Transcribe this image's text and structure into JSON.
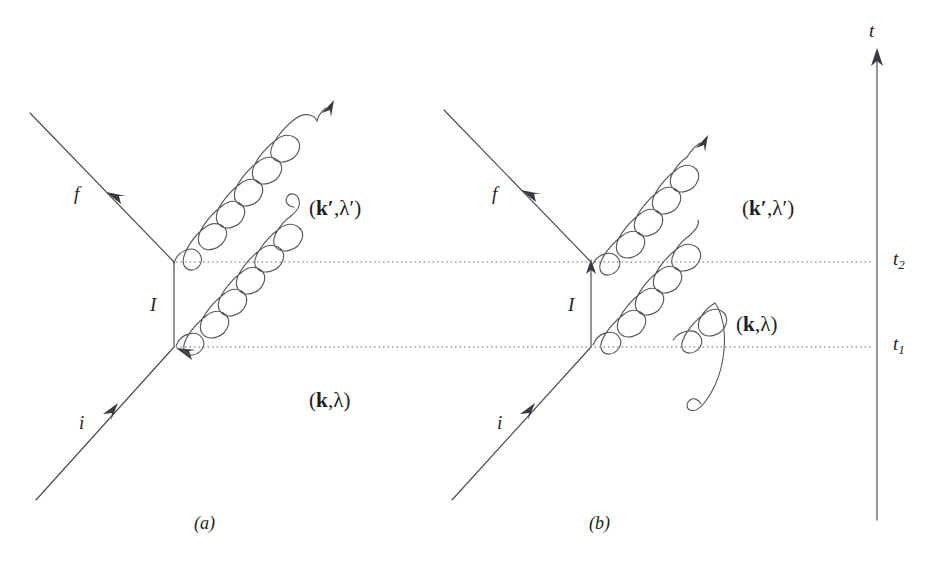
{
  "figure": {
    "type": "feynman-diagram-pair",
    "background_color": "#ffffff",
    "line_color": "#4a4a50",
    "text_color": "#1e1e22",
    "width": 933,
    "height": 566
  },
  "time_axis": {
    "label": "t",
    "direction": "upward",
    "x": 877,
    "top_y": 55,
    "bottom_y": 520,
    "ticks": [
      {
        "name": "t-two",
        "label": "t",
        "subscript": "2",
        "y": 262
      },
      {
        "name": "t-one",
        "label": "t",
        "subscript": "1",
        "y": 347
      }
    ]
  },
  "dotted_lines": [
    {
      "name": "time-line-t2",
      "y": 262,
      "x1": 176,
      "x2": 877
    },
    {
      "name": "time-line-t1",
      "y": 347,
      "x1": 176,
      "x2": 877
    }
  ],
  "diagrams": [
    {
      "id": "a",
      "caption": "(a)",
      "caption_x": 196,
      "caption_y": 516,
      "description": "uncrossed two-photon vertex ordering",
      "internal_line_label": "I",
      "internal_line_label_x": 152,
      "internal_line_label_y": 293,
      "fermion_out_label": "f",
      "fermion_out_label_x": 76,
      "fermion_out_label_y": 182,
      "fermion_in_label": "i",
      "fermion_in_label_x": 80,
      "fermion_in_label_y": 413,
      "photon_out_label": "(k′,λ′)",
      "photon_out_label_x": 311,
      "photon_out_label_y": 195,
      "photon_in_label": "(k,λ)",
      "photon_in_label_x": 311,
      "photon_in_label_y": 387,
      "vertex_top": {
        "x": 174,
        "y": 262
      },
      "vertex_bottom": {
        "x": 174,
        "y": 347
      }
    },
    {
      "id": "b",
      "caption": "(b)",
      "caption_x": 591,
      "caption_y": 516,
      "description": "crossed two-photon vertex ordering",
      "internal_line_label": "I",
      "internal_line_label_x": 570,
      "internal_line_label_y": 293,
      "fermion_out_label": "f",
      "fermion_out_label_x": 494,
      "fermion_out_label_y": 182,
      "fermion_in_label": "i",
      "fermion_in_label_x": 498,
      "fermion_in_label_y": 413,
      "photon_out_label": "(k′,λ′)",
      "photon_out_label_x": 744,
      "photon_out_label_y": 195,
      "photon_in_label": "(k,λ)",
      "photon_in_label_x": 737,
      "photon_in_label_y": 311,
      "vertex_top": {
        "x": 591,
        "y": 262
      },
      "vertex_bottom": {
        "x": 591,
        "y": 347
      }
    }
  ],
  "labels": {
    "k_bold": "k",
    "k_prime_bold": "k′",
    "lambda": "λ",
    "lambda_prime": "λ′",
    "open_paren": "(",
    "close_paren": ")",
    "comma": ","
  }
}
